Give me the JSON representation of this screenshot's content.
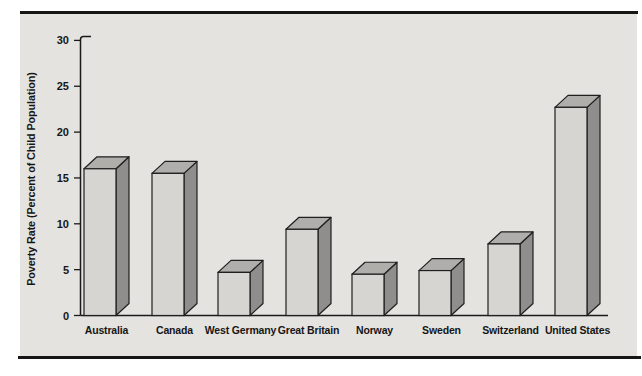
{
  "frame": {
    "top_rule_color": "#161616",
    "bottom_rule_color": "#161616",
    "panel_background": "#e5e3df"
  },
  "chart_data": {
    "type": "bar",
    "style": "3d-block",
    "title": "",
    "xlabel": "",
    "ylabel": "Poverty Rate (Percent of Child Population)",
    "categories": [
      "Australia",
      "Canada",
      "West Germany",
      "Great Britain",
      "Norway",
      "Sweden",
      "Switzerland",
      "United States"
    ],
    "values": [
      16,
      15.5,
      4.7,
      9.4,
      4.5,
      4.9,
      7.8,
      22.7
    ],
    "ylim": [
      0,
      30
    ],
    "ytick_interval": 5,
    "ytick_labels": [
      "0",
      "5",
      "10",
      "15",
      "20",
      "25",
      "30"
    ],
    "grid": false,
    "legend": "none",
    "colors": {
      "bar_front": "#d7d5d2",
      "bar_top": "#b0aeab",
      "bar_side": "#908e8c",
      "outline": "#1f1f1f",
      "axis": "#1a1a1a",
      "label_text": "#161616"
    },
    "layout": {
      "axis_x": 80.5,
      "baseline_y": 315.5,
      "px_per_unit": 9.17,
      "baseline_end_x": 608,
      "bar_x": [
        84,
        152,
        218,
        286,
        352,
        419,
        488,
        555
      ],
      "bar_width": 32,
      "depth_dx": 13,
      "depth_dy": 12,
      "category_label_y": 334
    }
  }
}
